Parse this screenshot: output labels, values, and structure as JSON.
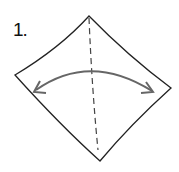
{
  "diagram": {
    "type": "origami-step",
    "step_label": "1.",
    "shape": "square-diamond",
    "fold_line": "valley-fold-dashed-vertical",
    "arrow": "curved-double-headed",
    "colors": {
      "outline": "#222222",
      "fold_line": "#444444",
      "arrow": "#666666",
      "background": "#ffffff"
    }
  }
}
